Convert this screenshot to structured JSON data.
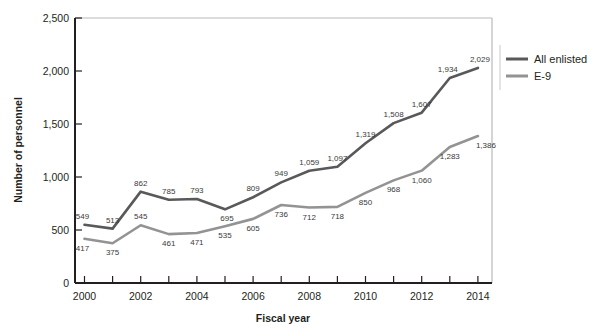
{
  "chart_data": {
    "type": "line",
    "title": "",
    "xlabel": "Fiscal year",
    "ylabel": "Number of personnel",
    "x": [
      2000,
      2001,
      2002,
      2003,
      2004,
      2005,
      2006,
      2007,
      2008,
      2009,
      2010,
      2011,
      2012,
      2013,
      2014
    ],
    "categories": [
      "2000",
      "2001",
      "2002",
      "2003",
      "2004",
      "2005",
      "2006",
      "2007",
      "2008",
      "2009",
      "2010",
      "2011",
      "2012",
      "2013",
      "2014"
    ],
    "xlim": [
      2000,
      2014
    ],
    "ylim": [
      0,
      2500
    ],
    "ytick_labels": [
      "0",
      "500",
      "1,000",
      "1,500",
      "2,000",
      "2,500"
    ],
    "ytick_values": [
      0,
      500,
      1000,
      1500,
      2000,
      2500
    ],
    "xtick_labels": [
      "2000",
      "2002",
      "2004",
      "2006",
      "2008",
      "2010",
      "2012",
      "2014"
    ],
    "xtick_values": [
      2000,
      2002,
      2004,
      2006,
      2008,
      2010,
      2012,
      2014
    ],
    "grid": false,
    "legend_position": "right",
    "series": [
      {
        "name": "All enlisted",
        "color": "#595959",
        "values": [
          549,
          513,
          862,
          785,
          793,
          695,
          809,
          949,
          1059,
          1097,
          1319,
          1508,
          1607,
          1934,
          2029
        ],
        "labels": [
          "549",
          "513",
          "862",
          "785",
          "793",
          "695",
          "809",
          "949",
          "1,059",
          "1,097",
          "1,319",
          "1,508",
          "1,607",
          "1,934",
          "2,029"
        ]
      },
      {
        "name": "E-9",
        "color": "#939393",
        "values": [
          417,
          375,
          545,
          461,
          471,
          535,
          605,
          736,
          712,
          718,
          850,
          968,
          1060,
          1283,
          1386
        ],
        "labels": [
          "417",
          "375",
          "545",
          "461",
          "471",
          "535",
          "605",
          "736",
          "712",
          "718",
          "850",
          "968",
          "1,060",
          "1,283",
          "1,386"
        ]
      }
    ]
  },
  "legend": {
    "items": [
      {
        "label": "All enlisted",
        "color": "#595959"
      },
      {
        "label": "E-9",
        "color": "#939393"
      }
    ]
  },
  "axes": {
    "y_title": "Number of personnel",
    "x_title": "Fiscal year"
  },
  "colors": {
    "all_enlisted": "#595959",
    "e9": "#939393",
    "axis": "#231f20",
    "frame": "#b9b9b9",
    "background": "#ffffff"
  }
}
